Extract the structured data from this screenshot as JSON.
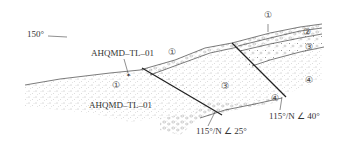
{
  "diagram": {
    "type": "geological-cross-section",
    "direction_label": "150°",
    "samples": [
      {
        "id": "sample-top",
        "label": "AHQMD–TL–01"
      },
      {
        "id": "sample-bottom",
        "label": "AHQMD–TL–01"
      }
    ],
    "layer_labels": {
      "l1_top": "①",
      "l2_top": "②",
      "l3_top": "③",
      "l4_right": "④",
      "l1_mid": "①",
      "l1_left": "①",
      "l3_center": "③",
      "l4_center": "④"
    },
    "faults": [
      {
        "id": "fault-left",
        "attitude": "115°/N ∠ 25°"
      },
      {
        "id": "fault-right",
        "attitude": "115°/N ∠ 40°"
      }
    ],
    "colors": {
      "line": "#333333",
      "text": "#333333",
      "background": "#ffffff"
    }
  }
}
